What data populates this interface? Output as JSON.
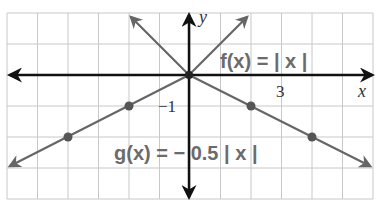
{
  "chart_data": {
    "type": "line",
    "title": "",
    "xlabel": "x",
    "ylabel": "y",
    "xlim": [
      -6,
      6
    ],
    "ylim": [
      -4,
      2
    ],
    "grid": true,
    "tick_labels": [
      {
        "axis": "x",
        "value": 3,
        "label": "3"
      },
      {
        "axis": "y",
        "value": -1,
        "label": "−1"
      }
    ],
    "series": [
      {
        "name": "f(x) = | x |",
        "label": "f(x) = | x |",
        "formula": "|x|",
        "x": [
          -2,
          0,
          2
        ],
        "y": [
          2,
          0,
          2
        ],
        "marked_points": [],
        "color": "#666666"
      },
      {
        "name": "g(x) = − 0.5 | x |",
        "label": "g(x) = − 0.5 | x |",
        "formula": "-0.5|x|",
        "x": [
          -6,
          -4,
          -2,
          0,
          2,
          4,
          6
        ],
        "y": [
          -3,
          -2,
          -1,
          0,
          -1,
          -2,
          -3
        ],
        "marked_points": [
          [
            -4,
            -2
          ],
          [
            -2,
            -1
          ],
          [
            0,
            0
          ],
          [
            2,
            -1
          ],
          [
            4,
            -2
          ]
        ],
        "color": "#666666"
      }
    ],
    "legend_position": "inline annotations"
  },
  "labels": {
    "x_axis": "x",
    "y_axis": "y",
    "tick_x3": "3",
    "tick_yneg1": "−1",
    "f_label": "f(x) = | x |",
    "g_label": "g(x) = − 0.5 | x |"
  },
  "colors": {
    "grid": "#c8c8c8",
    "axis": "#111111",
    "curve": "#666666",
    "label": "#6b6b6b"
  }
}
